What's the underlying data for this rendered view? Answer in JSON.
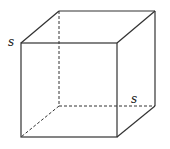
{
  "diagram": {
    "type": "cube",
    "edge_label_left": "s",
    "edge_label_bottom_right": "s",
    "line_color": "#333333",
    "hidden_edge_style": "dashed"
  }
}
